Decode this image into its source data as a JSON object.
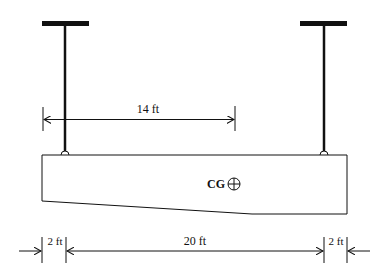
{
  "diagram": {
    "type": "beam-supported-by-two-hangers",
    "colors": {
      "stroke": "#111111",
      "background": "#ffffff"
    },
    "labels": {
      "dim_top": "14 ft",
      "cg": "CG",
      "dim_left": "2 ft",
      "dim_mid": "20 ft",
      "dim_right": "2 ft"
    },
    "icons": {
      "cg_marker": "circle-plus-icon"
    }
  }
}
